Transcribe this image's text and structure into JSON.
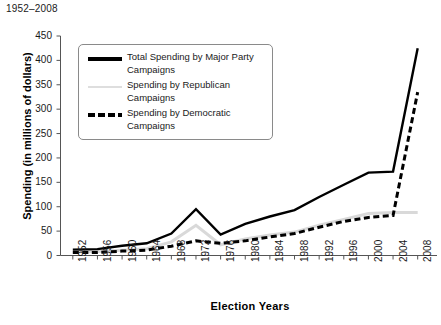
{
  "chart_data": {
    "type": "line",
    "title": "1952–2008",
    "xlabel": "Election Years",
    "ylabel": "Spending (in millions of dollars)",
    "categories": [
      "1952",
      "1956",
      "1960",
      "1964",
      "1968",
      "1972",
      "1976",
      "1980",
      "1984",
      "1988",
      "1992",
      "1996",
      "2000",
      "2004",
      "2008"
    ],
    "ylim": [
      0,
      450
    ],
    "yticks": [
      0,
      50,
      100,
      150,
      200,
      250,
      300,
      350,
      400,
      450
    ],
    "ytick_labels": [
      "0",
      "50",
      "100",
      "150",
      "200",
      "250",
      "300",
      "350",
      "400",
      "450"
    ],
    "grid": false,
    "legend_position": "upper-left-inside",
    "series": [
      {
        "name": "Total Spending by Major Party Campaigns",
        "style": "solid",
        "color": "#000000",
        "values": [
          12,
          13,
          20,
          25,
          45,
          95,
          43,
          65,
          80,
          93,
          120,
          145,
          170,
          172,
          425
        ]
      },
      {
        "name": "Spending by Republican Campaigns",
        "style": "solid",
        "color": "#d9d9d9",
        "values": [
          7,
          8,
          11,
          14,
          28,
          62,
          22,
          34,
          42,
          48,
          62,
          74,
          86,
          88,
          88
        ]
      },
      {
        "name": "Spending by Democratic Campaigns",
        "style": "dashed",
        "color": "#000000",
        "values": [
          6,
          6,
          9,
          11,
          19,
          30,
          25,
          30,
          38,
          45,
          58,
          70,
          78,
          82,
          335
        ]
      }
    ]
  },
  "legend": {
    "entries": [
      {
        "label": "Total Spending by Major Party Campaigns"
      },
      {
        "label": "Spending by Republican Campaigns"
      },
      {
        "label": "Spending by Democratic Campaigns"
      }
    ]
  }
}
